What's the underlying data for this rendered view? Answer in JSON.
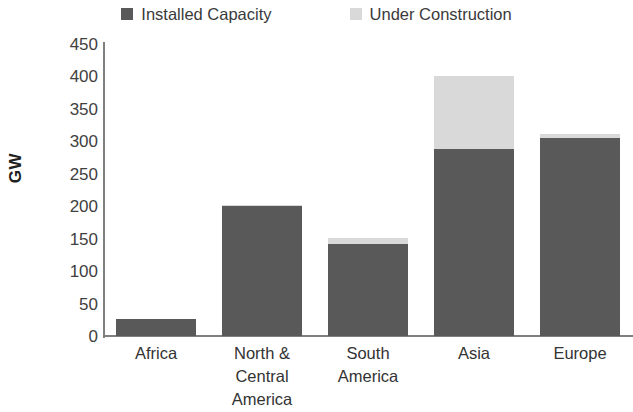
{
  "legend": {
    "entries": [
      {
        "label": "Installed Capacity",
        "swatch_name": "legend-swatch-installed-capacity",
        "color": "#595959"
      },
      {
        "label": "Under Construction",
        "swatch_name": "legend-swatch-under-construction",
        "color": "#d9d9d9"
      }
    ]
  },
  "axes": {
    "y_title": "GW",
    "y_ticks": [
      "450",
      "400",
      "350",
      "300",
      "250",
      "200",
      "150",
      "100",
      "50",
      "0"
    ]
  },
  "chart_data": {
    "type": "bar",
    "stacked": true,
    "title": "",
    "subtitle": "",
    "xlabel": "",
    "ylabel": "GW",
    "ylim": [
      0,
      450
    ],
    "ytick_step": 50,
    "grid": false,
    "legend_position": "top-center",
    "categories": [
      "Africa",
      "North & Central America",
      "South America",
      "Asia",
      "Europe"
    ],
    "category_label_lines": [
      [
        "Africa"
      ],
      [
        "North &",
        "Central",
        "America"
      ],
      [
        "South",
        "America"
      ],
      [
        "Asia"
      ],
      [
        "Europe"
      ]
    ],
    "series": [
      {
        "name": "Installed Capacity",
        "color": "#595959",
        "values": [
          26,
          200,
          142,
          288,
          305
        ]
      },
      {
        "name": "Under Construction",
        "color": "#d9d9d9",
        "values": [
          0,
          2,
          9,
          112,
          6
        ]
      }
    ],
    "totals": [
      26,
      202,
      151,
      400,
      311
    ]
  }
}
